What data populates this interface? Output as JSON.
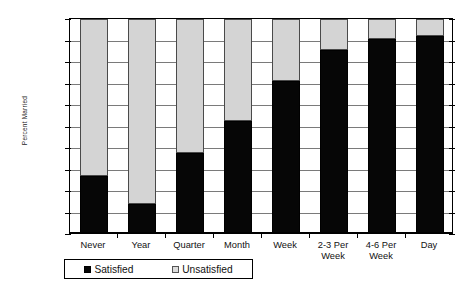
{
  "chart_data": {
    "type": "bar",
    "subtype": "stacked-100-percent",
    "title": "",
    "xlabel": "",
    "ylabel": "Percent Married",
    "ylim": [
      0,
      100
    ],
    "ytick_labels": [
      "0%",
      "10%",
      "20%",
      "30%",
      "40%",
      "50%",
      "60%",
      "70%",
      "80%",
      "90%",
      "100%"
    ],
    "ytick_values": [
      0,
      10,
      20,
      30,
      40,
      50,
      60,
      70,
      80,
      90,
      100
    ],
    "grid": true,
    "legend_position": "bottom-left",
    "categories": [
      "Never",
      "Year",
      "Quarter",
      "Month",
      "Week",
      "2-3 Per\nWeek",
      "4-6 Per\nWeek",
      "Day"
    ],
    "series": [
      {
        "name": "Satisfied",
        "color": "#060606",
        "values": [
          27,
          14,
          37.5,
          52.5,
          71,
          85.5,
          90.5,
          92
        ]
      },
      {
        "name": "Unsatisfied",
        "color": "#d4d4d4",
        "values": [
          73,
          86,
          62.5,
          47.5,
          29,
          14.5,
          9.5,
          8
        ]
      }
    ]
  },
  "legend": {
    "items": [
      {
        "label": "Satisfied",
        "icon": "filled-square-icon"
      },
      {
        "label": "Unsatisfied",
        "icon": "empty-square-icon"
      }
    ]
  }
}
